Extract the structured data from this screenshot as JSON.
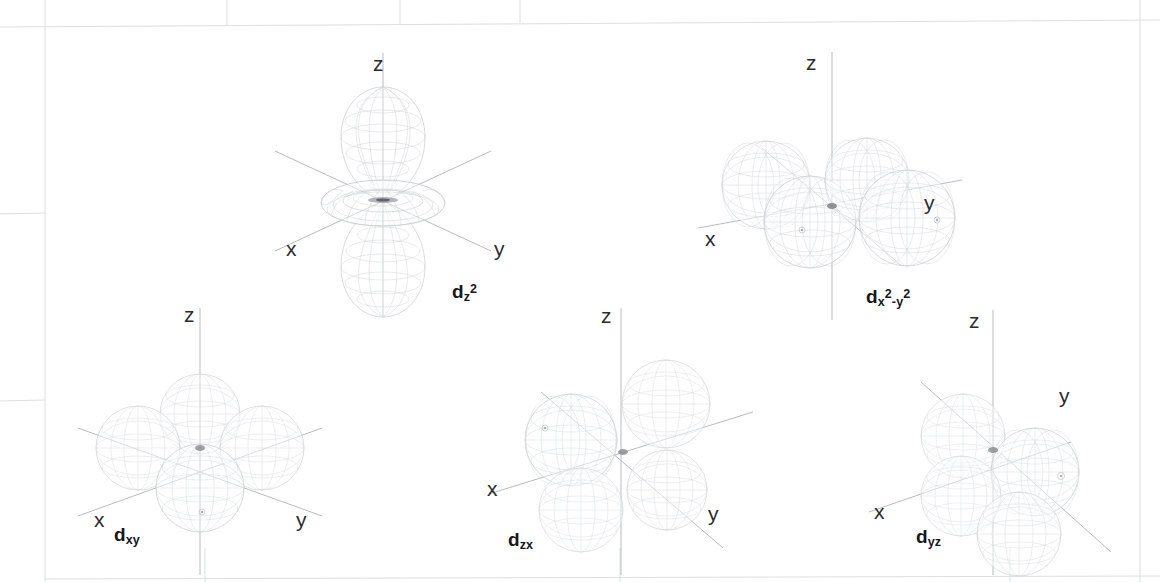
{
  "figure": {
    "background_color": "#ffffff",
    "axis_label_color": "#2b2b2b",
    "orbital_label_color": "#15181c",
    "wireframe_color": "#c9ccd2",
    "axis_line_color": "#b4b7bd",
    "scan_grid_color": "#d8dade"
  },
  "axis_names": {
    "x": "x",
    "y": "y",
    "z": "z"
  },
  "orbitals": [
    {
      "id": "dz2",
      "label_parts": {
        "base": "d",
        "sub": "z",
        "sup": "2"
      },
      "label_text": "dz2",
      "shape": "dz2",
      "lobes": 2,
      "has_torus": true,
      "center": {
        "x": 383,
        "y": 201
      },
      "label_pos": {
        "x": 452,
        "y": 282
      },
      "axes": {
        "x": {
          "label_x": 286,
          "label_y": 238
        },
        "y": {
          "label_x": 494,
          "label_y": 238
        },
        "z": {
          "label_x": 373,
          "label_y": 53
        }
      }
    },
    {
      "id": "dx2-y2",
      "label_parts": {
        "base": "d",
        "sub1": "x",
        "sup1": "2",
        "dash": "-",
        "sub2": "y",
        "sup2": "2"
      },
      "label_text": "dx2-y2",
      "shape": "cloverleaf-on-axis",
      "lobes": 4,
      "has_torus": false,
      "center": {
        "x": 832,
        "y": 196
      },
      "label_pos": {
        "x": 866,
        "y": 287
      },
      "axes": {
        "x": {
          "label_x": 705,
          "label_y": 228
        },
        "y": {
          "label_x": 924,
          "label_y": 192
        },
        "z": {
          "label_x": 806,
          "label_y": 52
        }
      }
    },
    {
      "id": "dxy",
      "label_parts": {
        "base": "d",
        "sub": "xy"
      },
      "label_text": "dxy",
      "shape": "cloverleaf-between-axis",
      "lobes": 4,
      "has_torus": false,
      "center": {
        "x": 200,
        "y": 447
      },
      "label_pos": {
        "x": 114,
        "y": 525
      },
      "axes": {
        "x": {
          "label_x": 94,
          "label_y": 509
        },
        "y": {
          "label_x": 296,
          "label_y": 509
        },
        "z": {
          "label_x": 184,
          "label_y": 304
        }
      }
    },
    {
      "id": "dzx",
      "label_parts": {
        "base": "d",
        "sub": "zx"
      },
      "label_text": "dzx",
      "shape": "cloverleaf-xz",
      "lobes": 4,
      "has_torus": false,
      "center": {
        "x": 621,
        "y": 450
      },
      "label_pos": {
        "x": 508,
        "y": 530
      },
      "axes": {
        "x": {
          "label_x": 487,
          "label_y": 478
        },
        "y": {
          "label_x": 708,
          "label_y": 503
        },
        "z": {
          "label_x": 601,
          "label_y": 305
        }
      }
    },
    {
      "id": "dyz",
      "label_parts": {
        "base": "d",
        "sub": "yz"
      },
      "label_text": "dyz",
      "shape": "cloverleaf-yz",
      "lobes": 4,
      "has_torus": false,
      "center": {
        "x": 993,
        "y": 448
      },
      "label_pos": {
        "x": 916,
        "y": 527
      },
      "axes": {
        "x": {
          "label_x": 874,
          "label_y": 501
        },
        "y": {
          "label_x": 1059,
          "label_y": 385
        },
        "z": {
          "label_x": 969,
          "label_y": 310
        }
      }
    }
  ],
  "scan_artifacts": {
    "description": "faint printed page grid lines from the scan",
    "vertical_lines": [
      45,
      227,
      400,
      520,
      620,
      1010,
      1140,
      205
    ],
    "horizontal_lines": [
      25,
      213,
      400,
      578
    ]
  }
}
